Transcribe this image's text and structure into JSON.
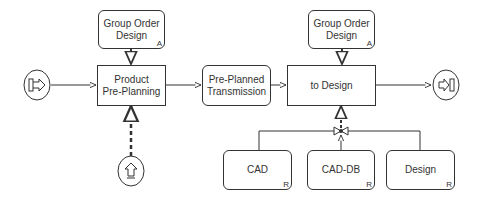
{
  "diagram": {
    "type": "process-flow",
    "nodes": {
      "start_event": {
        "icon": "start-event-icon"
      },
      "group_order_design_left": {
        "label": "Group Order\nDesign",
        "tag": "A"
      },
      "product_pre_planning": {
        "label": "Product\nPre-Planning"
      },
      "pre_planned_transmission": {
        "label": "Pre-Planned\nTransmission"
      },
      "group_order_design_right": {
        "label": "Group Order\nDesign",
        "tag": "A"
      },
      "to_design": {
        "label": "to Design"
      },
      "end_event": {
        "icon": "end-event-icon"
      },
      "upload_event": {
        "icon": "upload-arrow-icon"
      },
      "cad": {
        "label": "CAD",
        "tag": "R"
      },
      "cad_db": {
        "label": "CAD-DB",
        "tag": "R"
      },
      "design": {
        "label": "Design",
        "tag": "R"
      }
    },
    "edges": [
      {
        "from": "start_event",
        "to": "product_pre_planning",
        "style": "solid"
      },
      {
        "from": "group_order_design_left",
        "to": "product_pre_planning",
        "style": "dashed"
      },
      {
        "from": "upload_event",
        "to": "product_pre_planning",
        "style": "dashed"
      },
      {
        "from": "product_pre_planning",
        "to": "pre_planned_transmission",
        "style": "solid"
      },
      {
        "from": "pre_planned_transmission",
        "to": "to_design",
        "style": "solid"
      },
      {
        "from": "group_order_design_right",
        "to": "to_design",
        "style": "dashed"
      },
      {
        "from": "to_design",
        "to": "end_event",
        "style": "solid"
      },
      {
        "from": "cad",
        "to": "junction",
        "style": "solid"
      },
      {
        "from": "cad_db",
        "to": "junction",
        "style": "solid"
      },
      {
        "from": "design",
        "to": "junction",
        "style": "solid"
      },
      {
        "from": "junction",
        "to": "to_design",
        "style": "dashed"
      }
    ],
    "colors": {
      "stroke": "#333333",
      "fill": "#ffffff"
    }
  }
}
